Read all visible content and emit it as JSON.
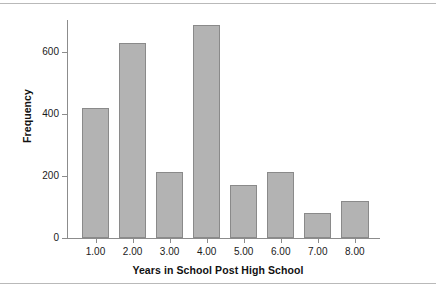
{
  "chart_data": {
    "type": "bar",
    "title": "",
    "xlabel": "Years in School Post High School",
    "ylabel": "Frequency",
    "categories": [
      "1.00",
      "2.00",
      "3.00",
      "4.00",
      "5.00",
      "6.00",
      "7.00",
      "8.00"
    ],
    "values": [
      420,
      628,
      212,
      688,
      172,
      212,
      80,
      120
    ],
    "ylim": [
      0,
      700
    ],
    "yticks": [
      0,
      200,
      400,
      600
    ],
    "ytick_labels": [
      "0",
      "200",
      "400",
      "600"
    ],
    "grid": false,
    "legend": null,
    "bar_color": "#b3b3b3",
    "bar_edge_color": "#8a8a8a",
    "axis_color": "#8c8c8c",
    "text_color": "#111111",
    "background": "#ffffff"
  },
  "figure": {
    "rule_top_label": "top-divider",
    "rule_bottom_label": "bottom-divider"
  }
}
